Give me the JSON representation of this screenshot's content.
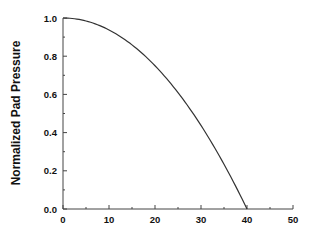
{
  "chart_data": {
    "type": "line",
    "title": "",
    "xlabel": "",
    "ylabel": "Normalized Pad Pressure",
    "xlim": [
      0,
      50
    ],
    "ylim": [
      0,
      1.0
    ],
    "x_ticks": [
      0,
      10,
      20,
      30,
      40,
      50
    ],
    "x_tick_labels": [
      "0",
      "10",
      "20",
      "30",
      "40",
      "50"
    ],
    "y_ticks": [
      0.0,
      0.2,
      0.4,
      0.6,
      0.8,
      1.0
    ],
    "y_tick_labels": [
      "0.0",
      "0.2",
      "0.4",
      "0.6",
      "0.8",
      "1.0"
    ],
    "grid": false,
    "legend": null,
    "series": [
      {
        "name": "pad pressure",
        "color": "#333333",
        "x": [
          0,
          5,
          10,
          15,
          20,
          25,
          30,
          35,
          40
        ],
        "y": [
          1.0,
          0.984,
          0.9375,
          0.859,
          0.75,
          0.609,
          0.4375,
          0.234,
          0.0
        ]
      }
    ]
  }
}
